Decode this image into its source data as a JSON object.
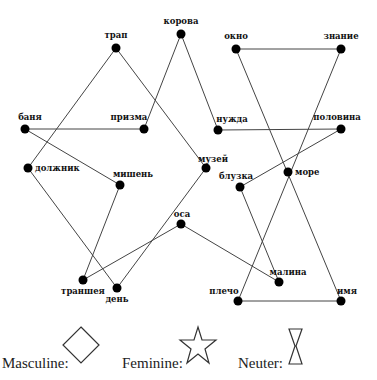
{
  "nodes": [
    {
      "id": "trap",
      "label": "трап",
      "x": 116,
      "y": 48,
      "lx": 116,
      "ly": 38,
      "anchor": "middle"
    },
    {
      "id": "korova",
      "label": "корова",
      "x": 181,
      "y": 34,
      "lx": 181,
      "ly": 24,
      "anchor": "middle"
    },
    {
      "id": "okno",
      "label": "окно",
      "x": 236,
      "y": 49,
      "lx": 236,
      "ly": 39,
      "anchor": "middle"
    },
    {
      "id": "znanie",
      "label": "знание",
      "x": 341,
      "y": 49,
      "lx": 341,
      "ly": 39,
      "anchor": "middle"
    },
    {
      "id": "banya",
      "label": "баня",
      "x": 25,
      "y": 129,
      "lx": 30,
      "ly": 120,
      "anchor": "middle"
    },
    {
      "id": "prizma",
      "label": "призма",
      "x": 144,
      "y": 129,
      "lx": 129,
      "ly": 120,
      "anchor": "middle"
    },
    {
      "id": "nuzhda",
      "label": "нужда",
      "x": 218,
      "y": 130,
      "lx": 232,
      "ly": 122,
      "anchor": "middle"
    },
    {
      "id": "polovina",
      "label": "половина",
      "x": 341,
      "y": 129,
      "lx": 337,
      "ly": 120,
      "anchor": "middle"
    },
    {
      "id": "dolzhnik",
      "label": "должник",
      "x": 28,
      "y": 168,
      "lx": 35,
      "ly": 171,
      "anchor": "start"
    },
    {
      "id": "mishen",
      "label": "мишень",
      "x": 120,
      "y": 185,
      "lx": 133,
      "ly": 177,
      "anchor": "middle"
    },
    {
      "id": "muzey",
      "label": "музей",
      "x": 206,
      "y": 168,
      "lx": 213,
      "ly": 162,
      "anchor": "middle"
    },
    {
      "id": "more",
      "label": "море",
      "x": 288,
      "y": 172,
      "lx": 295,
      "ly": 175,
      "anchor": "start"
    },
    {
      "id": "bluzka",
      "label": "блузка",
      "x": 240,
      "y": 187,
      "lx": 236,
      "ly": 179,
      "anchor": "middle"
    },
    {
      "id": "osa",
      "label": "оса",
      "x": 181,
      "y": 224,
      "lx": 182,
      "ly": 217,
      "anchor": "middle"
    },
    {
      "id": "transheya",
      "label": "траншея",
      "x": 83,
      "y": 280,
      "lx": 83,
      "ly": 294,
      "anchor": "middle"
    },
    {
      "id": "den",
      "label": "день",
      "x": 117,
      "y": 288,
      "lx": 117,
      "ly": 302,
      "anchor": "middle"
    },
    {
      "id": "malina",
      "label": "малина",
      "x": 279,
      "y": 282,
      "lx": 288,
      "ly": 275,
      "anchor": "middle"
    },
    {
      "id": "plecho",
      "label": "плечо",
      "x": 238,
      "y": 301,
      "lx": 224,
      "ly": 294,
      "anchor": "middle"
    },
    {
      "id": "imya",
      "label": "имя",
      "x": 341,
      "y": 301,
      "lx": 347,
      "ly": 294,
      "anchor": "middle"
    }
  ],
  "edges": [
    [
      "trap",
      "dolzhnik"
    ],
    [
      "trap",
      "muzey"
    ],
    [
      "korova",
      "prizma"
    ],
    [
      "korova",
      "nuzhda"
    ],
    [
      "okno",
      "znanie"
    ],
    [
      "okno",
      "imya"
    ],
    [
      "znanie",
      "plecho"
    ],
    [
      "banya",
      "prizma"
    ],
    [
      "banya",
      "mishen"
    ],
    [
      "nuzhda",
      "polovina"
    ],
    [
      "polovina",
      "bluzka"
    ],
    [
      "dolzhnik",
      "den"
    ],
    [
      "mishen",
      "transheya"
    ],
    [
      "muzey",
      "den"
    ],
    [
      "bluzka",
      "malina"
    ],
    [
      "osa",
      "transheya"
    ],
    [
      "osa",
      "malina"
    ],
    [
      "plecho",
      "imya"
    ]
  ],
  "legend": {
    "masculine_label": "Masculine:",
    "feminine_label": "Feminine:",
    "neuter_label": "Neuter:",
    "masculine_shape": "diamond",
    "feminine_shape": "star",
    "neuter_shape": "hourglass"
  },
  "colors": {
    "node": "#000000",
    "edge": "#444444",
    "text": "#111111",
    "background": "#ffffff"
  }
}
